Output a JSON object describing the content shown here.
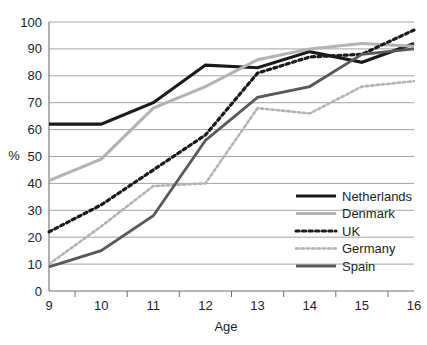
{
  "chart_data": {
    "type": "line",
    "title": "",
    "xlabel": "Age",
    "ylabel": "%",
    "x": [
      9,
      10,
      11,
      12,
      13,
      14,
      15,
      16
    ],
    "xtick_labels": [
      "9",
      "10",
      "11",
      "12",
      "13",
      "14",
      "15",
      "16"
    ],
    "ytick_labels": [
      "0",
      "10",
      "20",
      "30",
      "40",
      "50",
      "60",
      "70",
      "80",
      "90",
      "100"
    ],
    "ylim": [
      0,
      100
    ],
    "xlim": [
      9,
      16
    ],
    "grid": "horizontal",
    "legend_position": "inside-lower-right",
    "series": [
      {
        "name": "Netherlands",
        "values": [
          62,
          62,
          70,
          84,
          83,
          89,
          85,
          92
        ],
        "color": "#1a1a1a",
        "style": "solid",
        "width": 3.2
      },
      {
        "name": "Denmark",
        "values": [
          41,
          49,
          68,
          76,
          86,
          90,
          92,
          91
        ],
        "color": "#b3b3b3",
        "style": "solid",
        "width": 3.0
      },
      {
        "name": "UK",
        "values": [
          22,
          32,
          45,
          58,
          81,
          87,
          88,
          97
        ],
        "color": "#1a1a1a",
        "style": "dotted",
        "width": 3.2
      },
      {
        "name": "Germany",
        "values": [
          10,
          24,
          39,
          40,
          68,
          66,
          76,
          78
        ],
        "color": "#b3b3b3",
        "style": "dotted",
        "width": 2.6
      },
      {
        "name": "Spain",
        "values": [
          9,
          15,
          28,
          56,
          72,
          76,
          88,
          90
        ],
        "color": "#595959",
        "style": "solid",
        "width": 2.8
      }
    ]
  },
  "legend": {
    "items": [
      {
        "label": "Netherlands"
      },
      {
        "label": "Denmark"
      },
      {
        "label": "UK"
      },
      {
        "label": "Germany"
      },
      {
        "label": "Spain"
      }
    ]
  }
}
